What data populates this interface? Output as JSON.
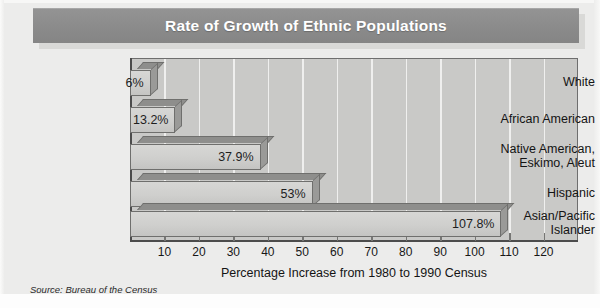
{
  "title": "Rate of Growth of Ethnic Populations",
  "source_note": "Source: Bureau of the Census",
  "chart_data": {
    "type": "bar",
    "orientation": "horizontal",
    "title": "Rate of Growth of Ethnic Populations",
    "xlabel": "Percentage Increase from 1980 to 1990 Census",
    "ylabel": "",
    "categories": [
      "White",
      "African American",
      "Native American, Eskimo, Aleut",
      "Hispanic",
      "Asian/Pacific Islander"
    ],
    "values": [
      6,
      13.2,
      37.9,
      53,
      107.8
    ],
    "value_labels": [
      "6%",
      "13.2%",
      "37.9%",
      "53%",
      "107.8%"
    ],
    "xticks": [
      10,
      20,
      30,
      40,
      50,
      60,
      70,
      80,
      90,
      100,
      110,
      120
    ],
    "xtick_labels": [
      "10",
      "20",
      "30",
      "40",
      "50",
      "60",
      "70",
      "80",
      "90",
      "100",
      "110",
      "120"
    ],
    "xlim": [
      0,
      130
    ],
    "grid": true,
    "legend": false,
    "colors": {
      "bar_face": "#d2d2d0",
      "bar_shade": "#93938f",
      "plot_background": "#c9c9c7",
      "gridline": "#efefee",
      "banner": "#8d8d8d",
      "banner_text": "#ffffff",
      "axis": "#4c4c4c",
      "page_background": "#ececeb"
    }
  }
}
